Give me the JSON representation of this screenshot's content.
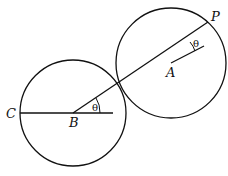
{
  "diagram": {
    "labels": {
      "C": "C",
      "B": "B",
      "A": "A",
      "P": "P",
      "theta_B": "θ",
      "theta_A": "θ"
    },
    "stroke_color": "#111111",
    "background": "#ffffff"
  }
}
